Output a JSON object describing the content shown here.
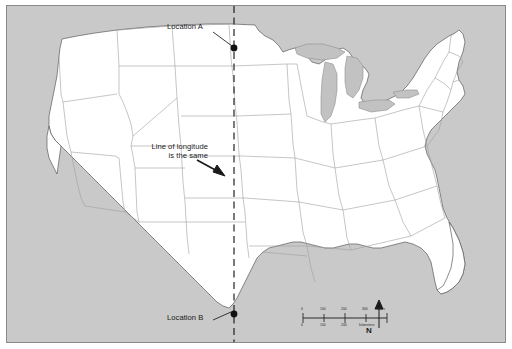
{
  "map": {
    "title": "United States map showing two locations on the same line of longitude",
    "background_color": "#c9c9c9",
    "land_color": "#ffffff",
    "border_color": "#8a8a8a",
    "state_line_color": "#9a9a9a",
    "coast_line_color": "#5a5a5a",
    "annotation_color": "#1a1a1a"
  },
  "annotations": {
    "location_a": "Location A",
    "location_b": "Location B",
    "longitude_line_1": "Line of longitude",
    "longitude_line_2": "is the same",
    "longitude_full": "Line of longitude is the same"
  },
  "markers": [
    {
      "name": "Location A",
      "x": 233,
      "y": 47
    },
    {
      "name": "Location B",
      "x": 233,
      "y": 313
    }
  ],
  "longitude_line": {
    "style": "dashed",
    "x": 233,
    "color": "#1a1a1a"
  },
  "compass": {
    "label": "N",
    "direction": "north"
  },
  "scale_bar": {
    "miles_label": "miles",
    "kilometers_label": "kilometers",
    "miles_ticks": [
      "0",
      "100",
      "200",
      "300"
    ],
    "km_ticks": [
      "0",
      "100",
      "200",
      "300"
    ]
  }
}
